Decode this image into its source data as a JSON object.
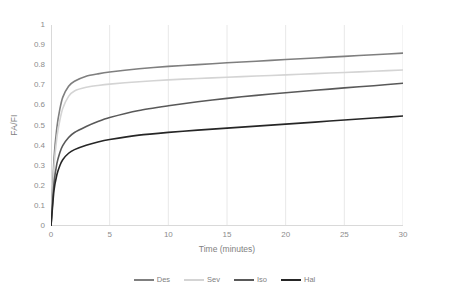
{
  "chart_data": {
    "type": "line",
    "title": "",
    "xlabel": "Time (minutes)",
    "ylabel": "FA/FI",
    "xlim": [
      0,
      30
    ],
    "ylim": [
      0,
      1
    ],
    "xticks": [
      "0",
      "5",
      "10",
      "15",
      "20",
      "25",
      "30"
    ],
    "yticks": [
      "0",
      "0.1",
      "0.2",
      "0.3",
      "0.4",
      "0.5",
      "0.6",
      "0.7",
      "0.8",
      "0.9",
      "1"
    ],
    "grid": "vertical-only",
    "legend_position": "bottom",
    "x": [
      0,
      0.25,
      0.5,
      0.75,
      1,
      1.5,
      2,
      3,
      4,
      5,
      7.5,
      10,
      12.5,
      15,
      17.5,
      20,
      22.5,
      25,
      27.5,
      30
    ],
    "series": [
      {
        "name": "Des",
        "color": "#7f7f7f",
        "values": [
          0,
          0.33,
          0.49,
          0.58,
          0.64,
          0.695,
          0.72,
          0.745,
          0.757,
          0.766,
          0.782,
          0.794,
          0.803,
          0.812,
          0.82,
          0.828,
          0.836,
          0.844,
          0.852,
          0.86
        ]
      },
      {
        "name": "Sev",
        "color": "#d4d4d4",
        "values": [
          0,
          0.29,
          0.44,
          0.525,
          0.585,
          0.645,
          0.672,
          0.69,
          0.699,
          0.706,
          0.718,
          0.727,
          0.734,
          0.74,
          0.746,
          0.752,
          0.758,
          0.764,
          0.77,
          0.776
        ]
      },
      {
        "name": "Iso",
        "color": "#595959",
        "values": [
          0,
          0.21,
          0.31,
          0.365,
          0.4,
          0.44,
          0.465,
          0.495,
          0.52,
          0.54,
          0.575,
          0.598,
          0.618,
          0.635,
          0.65,
          0.663,
          0.675,
          0.687,
          0.698,
          0.71
        ]
      },
      {
        "name": "Hal",
        "color": "#262626",
        "values": [
          0,
          0.175,
          0.255,
          0.3,
          0.33,
          0.362,
          0.38,
          0.402,
          0.418,
          0.43,
          0.452,
          0.466,
          0.477,
          0.487,
          0.497,
          0.507,
          0.517,
          0.527,
          0.537,
          0.547
        ]
      }
    ]
  },
  "axes": {
    "y_title": "FA/FI",
    "x_title": "Time (minutes)",
    "y_ticks": [
      {
        "label": "1"
      },
      {
        "label": "0.9"
      },
      {
        "label": "0.8"
      },
      {
        "label": "0.7"
      },
      {
        "label": "0.6"
      },
      {
        "label": "0.5"
      },
      {
        "label": "0.4"
      },
      {
        "label": "0.3"
      },
      {
        "label": "0.2"
      },
      {
        "label": "0.1"
      },
      {
        "label": "0"
      }
    ],
    "x_ticks": [
      {
        "label": "0"
      },
      {
        "label": "5"
      },
      {
        "label": "10"
      },
      {
        "label": "15"
      },
      {
        "label": "20"
      },
      {
        "label": "25"
      },
      {
        "label": "30"
      }
    ]
  },
  "legend": {
    "items": [
      {
        "label": "Des",
        "color": "#7f7f7f"
      },
      {
        "label": "Sev",
        "color": "#d4d4d4"
      },
      {
        "label": "Iso",
        "color": "#595959"
      },
      {
        "label": "Hal",
        "color": "#262626"
      }
    ]
  }
}
